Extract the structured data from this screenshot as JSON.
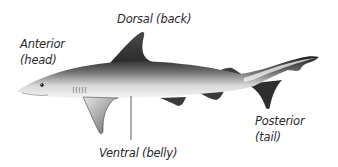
{
  "diagram": {
    "labels": {
      "anterior": {
        "term": "Anterior",
        "description": "(head)"
      },
      "dorsal": {
        "term": "Dorsal",
        "description": "(back)",
        "full": "Dorsal (back)"
      },
      "posterior": {
        "term": "Posterior",
        "description": "(tail)"
      },
      "ventral": {
        "term": "Ventral",
        "description": "(belly)",
        "full": "Ventral (belly)"
      }
    },
    "colors": {
      "body_dark": "#2b2b2b",
      "body_light": "#f2f2f2",
      "fin_dark": "#3a3a3a",
      "text": "#2a2a2a",
      "leader_line": "#333333"
    }
  }
}
